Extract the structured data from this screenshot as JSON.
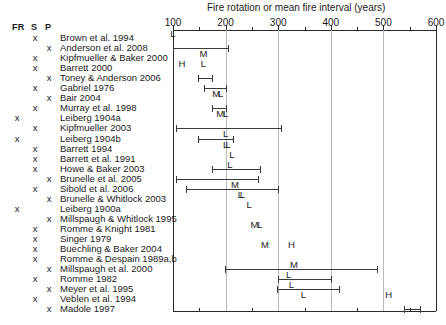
{
  "chart_data": {
    "type": "range-plot",
    "title": "Fire rotation or mean fire interval (years)",
    "xlabel": "Fire rotation or mean fire interval (years)",
    "ylabel": "",
    "xlim": [
      100,
      600
    ],
    "xticks": [
      100,
      200,
      300,
      400,
      500,
      600
    ],
    "xtick_labels": [
      "100",
      "200",
      "300",
      "400",
      "500",
      "600"
    ],
    "minor_tick_interval": 50,
    "grid": true,
    "legend_position": "none",
    "marker_legend": {
      "L": "low",
      "M": "moderate",
      "H": "high"
    },
    "columns": [
      "FR",
      "S",
      "P"
    ],
    "rows": [
      {
        "study": "Brown et al. 1994",
        "fr": false,
        "s": true,
        "p": false,
        "low": null,
        "high": null,
        "marker": "L",
        "marker_value": 100,
        "marker_above": true
      },
      {
        "study": "Anderson et al. 2008",
        "fr": false,
        "s": false,
        "p": true,
        "low": 100,
        "high": 205,
        "marker": "M",
        "marker_value": 158,
        "marker_above": false
      },
      {
        "study": "Kipfmueller & Baker 2000",
        "fr": false,
        "s": true,
        "p": false,
        "low": null,
        "high": null,
        "marker": "H",
        "marker_value": 117,
        "marker_above": false
      },
      {
        "study": "Barrett 2000",
        "fr": false,
        "s": true,
        "p": false,
        "low": null,
        "high": null,
        "marker": "L",
        "marker_value": 158,
        "marker_above": true
      },
      {
        "study": "Toney & Anderson 2006",
        "fr": false,
        "s": false,
        "p": true,
        "low": 148,
        "high": 175,
        "marker": "",
        "marker_value": 161,
        "marker_above": false
      },
      {
        "study": "Gabriel 1976",
        "fr": false,
        "s": true,
        "p": false,
        "low": 158,
        "high": 200,
        "marker": "M",
        "marker_value": 182,
        "marker_above": false
      },
      {
        "study": "Bair 2004",
        "fr": false,
        "s": false,
        "p": true,
        "low": null,
        "high": null,
        "marker": "L",
        "marker_value": 190,
        "marker_above": true
      },
      {
        "study": "Murray et al. 1998",
        "fr": false,
        "s": true,
        "p": false,
        "low": 175,
        "high": 200,
        "marker": "M",
        "marker_value": 190,
        "marker_above": false
      },
      {
        "study": "Leiberg 1904a",
        "fr": true,
        "s": false,
        "p": false,
        "low": null,
        "high": null,
        "marker": "L",
        "marker_value": 200,
        "marker_above": true
      },
      {
        "study": "Kipfmueller 2003",
        "fr": false,
        "s": true,
        "p": false,
        "low": 105,
        "high": 305,
        "marker": "L",
        "marker_value": 200,
        "marker_above": false
      },
      {
        "study": "Leiberg 1904b",
        "fr": true,
        "s": false,
        "p": false,
        "low": 148,
        "high": 215,
        "marker": "L",
        "marker_value": 200,
        "marker_above": false
      },
      {
        "study": "Barrett 1994",
        "fr": false,
        "s": true,
        "p": false,
        "low": null,
        "high": null,
        "marker": "L",
        "marker_value": 205,
        "marker_above": true
      },
      {
        "study": "Barrett et al. 1991",
        "fr": false,
        "s": true,
        "p": false,
        "low": null,
        "high": null,
        "marker": "L",
        "marker_value": 212,
        "marker_above": true
      },
      {
        "study": "Howe & Baker 2003",
        "fr": false,
        "s": true,
        "p": false,
        "low": 175,
        "high": 265,
        "marker": "L",
        "marker_value": 208,
        "marker_above": true
      },
      {
        "study": "Brunelle et al. 2005",
        "fr": false,
        "s": false,
        "p": true,
        "low": 105,
        "high": 262,
        "marker": "M",
        "marker_value": 218,
        "marker_above": false
      },
      {
        "study": "Sibold et al. 2006",
        "fr": false,
        "s": true,
        "p": false,
        "low": 125,
        "high": 300,
        "marker": "L",
        "marker_value": 232,
        "marker_above": false
      },
      {
        "study": "Brunelle & Whitlock 2003",
        "fr": false,
        "s": false,
        "p": true,
        "low": null,
        "high": null,
        "marker": "L",
        "marker_value": 228,
        "marker_above": true
      },
      {
        "study": "Leiberg 1900a",
        "fr": true,
        "s": false,
        "p": false,
        "low": null,
        "high": null,
        "marker": "L",
        "marker_value": 245,
        "marker_above": true
      },
      {
        "study": "Millspaugh & Whitlock 1995",
        "fr": false,
        "s": false,
        "p": true,
        "low": null,
        "high": null,
        "marker": "M",
        "marker_value": 255,
        "marker_above": false
      },
      {
        "study": "Romme & Knight 1981",
        "fr": false,
        "s": true,
        "p": false,
        "low": null,
        "high": null,
        "marker": "L",
        "marker_value": 265,
        "marker_above": true
      },
      {
        "study": "Singer 1979",
        "fr": false,
        "s": true,
        "p": false,
        "low": null,
        "high": null,
        "marker": "M",
        "marker_value": 275,
        "marker_above": false
      },
      {
        "study": "Buechling & Baker 2004",
        "fr": false,
        "s": true,
        "p": false,
        "low": null,
        "high": null,
        "marker": "H",
        "marker_value": 325,
        "marker_above": true
      },
      {
        "study": "Romme & Despain 1989a,b",
        "fr": false,
        "s": true,
        "p": false,
        "low": null,
        "high": null,
        "marker": "M",
        "marker_value": 330,
        "marker_above": false
      },
      {
        "study": "Millspaugh et al. 2000",
        "fr": false,
        "s": false,
        "p": true,
        "low": 198,
        "high": 488,
        "marker": "L",
        "marker_value": 320,
        "marker_above": false
      },
      {
        "study": "Romme 1982",
        "fr": false,
        "s": true,
        "p": false,
        "low": 300,
        "high": 400,
        "marker": "L",
        "marker_value": 325,
        "marker_above": false
      },
      {
        "study": "Meyer et al. 1995",
        "fr": false,
        "s": false,
        "p": true,
        "low": 298,
        "high": 415,
        "marker": "L",
        "marker_value": 348,
        "marker_above": false
      },
      {
        "study": "Veblen et al. 1994",
        "fr": false,
        "s": true,
        "p": false,
        "low": null,
        "high": null,
        "marker": "H",
        "marker_value": 510,
        "marker_above": true
      },
      {
        "study": "Madole 1997",
        "fr": false,
        "s": false,
        "p": true,
        "low": 540,
        "high": 570,
        "marker": "",
        "marker_value": 555,
        "marker_above": false
      }
    ]
  },
  "header": {
    "col_fr": "FR",
    "col_s": "S",
    "col_p": "P",
    "x_glyph": "x"
  }
}
